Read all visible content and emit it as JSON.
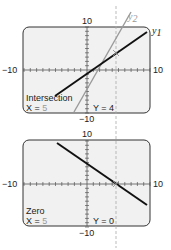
{
  "chart_data": [
    {
      "type": "line",
      "title": "Intersection",
      "window": {
        "xmin": -10,
        "xmax": 10,
        "ymin": -10,
        "ymax": 10,
        "xscl": 1,
        "yscl": 1
      },
      "axis_labels": {
        "left": "−10",
        "right": "10",
        "top": "10",
        "bottom": "−10"
      },
      "series": [
        {
          "name": "y1",
          "label": "y",
          "sub": "1",
          "equation": "y = x − 1",
          "slope": 1,
          "intercept": -1,
          "color": "#1a1a1a"
        },
        {
          "name": "y2",
          "label": "y",
          "sub": "2",
          "equation": "y = 2x − 6",
          "slope": 2,
          "intercept": -6,
          "color": "#9a9a9a"
        }
      ],
      "readout": {
        "title": "Intersection",
        "x_label": "X = ",
        "x_value": "5",
        "y_label": "Y = ",
        "y_value": "4"
      },
      "marker": {
        "x": 5,
        "y": 4
      },
      "trace_line_x": 5,
      "grid": false
    },
    {
      "type": "line",
      "title": "Zero",
      "window": {
        "xmin": -10,
        "xmax": 10,
        "ymin": -10,
        "ymax": 10,
        "xscl": 1,
        "yscl": 1
      },
      "axis_labels": {
        "left": "−10",
        "right": "10",
        "top": "10",
        "bottom": "−10"
      },
      "series": [
        {
          "name": "y1 − y2",
          "equation": "y = −x + 5",
          "slope": -1,
          "intercept": 5,
          "color": "#1a1a1a"
        }
      ],
      "readout": {
        "title": "Zero",
        "x_label": "X = ",
        "x_value": "5",
        "y_label": "Y = ",
        "y_value": "0"
      },
      "marker": {
        "x": 5,
        "y": 0
      },
      "trace_line_x": 5,
      "grid": false
    }
  ]
}
